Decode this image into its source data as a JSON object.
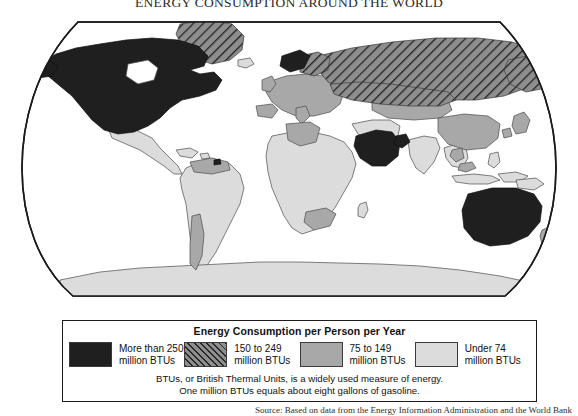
{
  "title": "ENERGY CONSUMPTION AROUND THE WORLD",
  "legend": {
    "heading": "Energy Consumption per Person per Year",
    "items": [
      {
        "swatch": "solid-dark",
        "line1": "More than 250",
        "line2": "million BTUs",
        "color": "#1f1f1f"
      },
      {
        "swatch": "hatched",
        "line1": "150 to 249",
        "line2": "million BTUs",
        "color": "#8e8e8e"
      },
      {
        "swatch": "solid-mid",
        "line1": "75 to 149",
        "line2": "million BTUs",
        "color": "#a8a8a8"
      },
      {
        "swatch": "solid-light",
        "line1": "Under 74",
        "line2": "million BTUs",
        "color": "#dcdcdc"
      }
    ],
    "note_line1": "BTUs, or British Thermal Units, is a widely used measure of energy.",
    "note_line2": "One million BTUs equals about eight gallons of gasoline."
  },
  "source": "Source: Based on data from the Energy Information Administration and the World Bank",
  "map": {
    "projection": "robinson",
    "ocean_color": "#ffffff",
    "outline_color": "#1a1a1a",
    "regions": [
      {
        "name": "United States",
        "category": "More than 250"
      },
      {
        "name": "Canada",
        "category": "More than 250"
      },
      {
        "name": "Greenland",
        "category": "150 to 249"
      },
      {
        "name": "Russia",
        "category": "150 to 249"
      },
      {
        "name": "Norway",
        "category": "More than 250"
      },
      {
        "name": "Saudi Arabia",
        "category": "More than 250"
      },
      {
        "name": "Gulf States",
        "category": "More than 250"
      },
      {
        "name": "Australia",
        "category": "More than 250"
      },
      {
        "name": "Western Europe",
        "category": "75 to 149"
      },
      {
        "name": "Eastern Europe",
        "category": "75 to 149"
      },
      {
        "name": "Kazakhstan",
        "category": "75 to 149"
      },
      {
        "name": "China",
        "category": "75 to 149"
      },
      {
        "name": "Japan",
        "category": "75 to 149"
      },
      {
        "name": "South Korea",
        "category": "75 to 149"
      },
      {
        "name": "Venezuela",
        "category": "75 to 149"
      },
      {
        "name": "Chile",
        "category": "75 to 149"
      },
      {
        "name": "South Africa",
        "category": "75 to 149"
      },
      {
        "name": "Libya",
        "category": "75 to 149"
      },
      {
        "name": "New Zealand",
        "category": "75 to 149"
      },
      {
        "name": "Malaysia",
        "category": "75 to 149"
      },
      {
        "name": "Mexico",
        "category": "Under 74"
      },
      {
        "name": "Central America",
        "category": "Under 74"
      },
      {
        "name": "Brazil",
        "category": "Under 74"
      },
      {
        "name": "Africa",
        "category": "Under 74"
      },
      {
        "name": "India",
        "category": "Under 74"
      },
      {
        "name": "Southeast Asia",
        "category": "Under 74"
      },
      {
        "name": "Antarctica",
        "category": "Under 74"
      }
    ]
  }
}
